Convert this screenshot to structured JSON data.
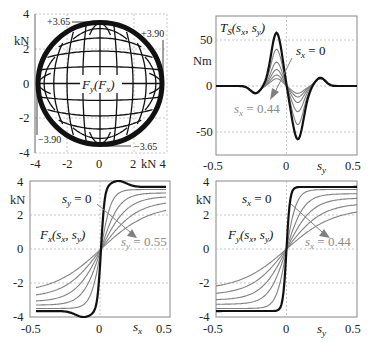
{
  "colors": {
    "dark": "#111111",
    "gray": "#808080",
    "grid": "#b8b8b8",
    "label_gray": "#8a8a8a"
  },
  "chart_data": [
    {
      "id": "friction-ellipse",
      "type": "line",
      "title": "F_y(F_x)",
      "xlabel": "kN",
      "ylabel": "kN",
      "xlim": [
        -4,
        4
      ],
      "ylim": [
        -4,
        4
      ],
      "xticks": [
        "-4",
        "-2",
        "0",
        "2",
        "4"
      ],
      "yticks": [
        "4",
        "2",
        "0",
        "-2",
        "-4"
      ],
      "x_unit_label": "kN",
      "y_unit_label": "kN",
      "grid": true,
      "annotations": [
        "+3.65",
        "+3.90",
        "-3.90",
        "-3.65"
      ],
      "description": "Combined-slip force grid: curves of constant s_x and s_y mapping to F_y vs F_x, bounded by an ellipse with Fx max ±3.90 kN and Fy max ±3.65 kN",
      "envelope": {
        "fx_max": 3.9,
        "fy_max": 3.65
      }
    },
    {
      "id": "self-aligning-torque",
      "type": "line",
      "title": "T_S(s_x, s_y)",
      "xlabel": "s_y",
      "ylabel": "Nm",
      "xlim": [
        -0.5,
        0.5
      ],
      "ylim": [
        -60,
        60
      ],
      "xticks": [
        "-0.5",
        "0",
        "0.5"
      ],
      "yticks": [
        "50",
        "0",
        "-50"
      ],
      "y_unit_label": "Nm",
      "grid": true,
      "legend_annotations": [
        "s_x = 0",
        "s_x = 0.44"
      ],
      "series": [
        {
          "name": "s_x=0",
          "peak": 58,
          "trough": -58
        },
        {
          "name": "s_x=0.088",
          "peak": 40,
          "trough": -42
        },
        {
          "name": "s_x=0.176",
          "peak": 26,
          "trough": -28
        },
        {
          "name": "s_x=0.264",
          "peak": 18,
          "trough": -18
        },
        {
          "name": "s_x=0.352",
          "peak": 12,
          "trough": -12
        },
        {
          "name": "s_x=0.44",
          "peak": 8,
          "trough": -8
        }
      ]
    },
    {
      "id": "longitudinal-force",
      "type": "line",
      "title": "F_x(s_x, s_y)",
      "xlabel": "s_x",
      "ylabel": "kN",
      "xlim": [
        -0.45,
        0.45
      ],
      "ylim": [
        -4,
        4
      ],
      "xticks": [
        "-0.5",
        "0",
        "0.5"
      ],
      "yticks": [
        "4",
        "2",
        "0",
        "-2",
        "-4"
      ],
      "y_unit_label": "kN",
      "grid": true,
      "legend_annotations": [
        "s_y = 0",
        "s_y = 0.55"
      ],
      "series": [
        {
          "name": "s_y=0",
          "peak": 3.9,
          "end": 3.65
        },
        {
          "name": "s_y=0.11",
          "end": 3.5
        },
        {
          "name": "s_y=0.22",
          "end": 3.3
        },
        {
          "name": "s_y=0.33",
          "end": 3.1
        },
        {
          "name": "s_y=0.44",
          "end": 2.85
        },
        {
          "name": "s_y=0.55",
          "end": 2.6
        }
      ]
    },
    {
      "id": "lateral-force",
      "type": "line",
      "title": "F_y(s_x, s_y)",
      "xlabel": "s_y",
      "ylabel": "kN",
      "xlim": [
        -0.5,
        0.5
      ],
      "ylim": [
        -4,
        4
      ],
      "xticks": [
        "-0.5",
        "0",
        "0.5"
      ],
      "yticks": [
        "4",
        "2",
        "0",
        "-2",
        "-4"
      ],
      "y_unit_label": "kN",
      "grid": true,
      "legend_annotations": [
        "s_x = 0",
        "s_x = 0.44"
      ],
      "series": [
        {
          "name": "s_x=0",
          "end": 3.65
        },
        {
          "name": "s_x=0.088",
          "end": 3.5
        },
        {
          "name": "s_x=0.176",
          "end": 3.25
        },
        {
          "name": "s_x=0.264",
          "end": 3.0
        },
        {
          "name": "s_x=0.352",
          "end": 2.7
        },
        {
          "name": "s_x=0.44",
          "end": 2.4
        }
      ]
    }
  ],
  "panels": {
    "p1": {
      "xticks": [
        "-4",
        "-2",
        "0",
        "2"
      ],
      "x_last": "kN 4",
      "yticks": [
        "4",
        "2",
        "0",
        "-2",
        "-4"
      ],
      "unit": "kN",
      "title": "Fy(Fx)",
      "ann": {
        "tl": "+3.65",
        "tr": "+3.90",
        "bl": "−3.90",
        "br": "−3.65"
      }
    },
    "p2": {
      "xticks": [
        "-0.5",
        "0",
        "0.5"
      ],
      "yticks": [
        "50",
        "0",
        "-50"
      ],
      "unit": "Nm",
      "xname": "s",
      "xsub": "y",
      "title_main": "T",
      "title_sub": "S",
      "title_args": "(s",
      "lab_top": "s",
      "lab_top_sub": "x",
      "lab_top_val": " = 0",
      "lab_bot": "s",
      "lab_bot_sub": "x",
      "lab_bot_val": " = 0.44"
    },
    "p3": {
      "xticks": [
        "-0.5",
        "0",
        "0.5"
      ],
      "yticks": [
        "4",
        "2",
        "0",
        "-2",
        "-4"
      ],
      "unit": "kN",
      "xname": "s",
      "xsub": "x",
      "lab_top": "s",
      "lab_top_sub": "y",
      "lab_top_val": " = 0",
      "lab_bot": "s",
      "lab_bot_sub": "y",
      "lab_bot_val": " = 0.55"
    },
    "p4": {
      "xticks": [
        "-0.5",
        "0",
        "0.5"
      ],
      "yticks": [
        "4",
        "2",
        "0",
        "-2",
        "-4"
      ],
      "unit": "kN",
      "xname": "s",
      "xsub": "y",
      "lab_top": "s",
      "lab_top_sub": "x",
      "lab_top_val": " = 0",
      "lab_bot": "s",
      "lab_bot_sub": "x",
      "lab_bot_val": " = 0.44"
    }
  }
}
